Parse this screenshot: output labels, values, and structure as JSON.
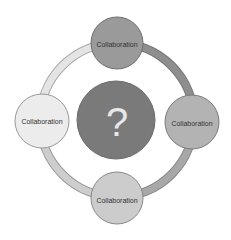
{
  "diagram": {
    "type": "cycle",
    "center": {
      "label": "?",
      "color": "#7a7a7a"
    },
    "nodes": [
      {
        "position": "top",
        "label": "Collaboration",
        "color": "#9a9a9a"
      },
      {
        "position": "right",
        "label": "Collaboration",
        "color": "#b3b3b3"
      },
      {
        "position": "bottom",
        "label": "Collaboration",
        "color": "#cccccc"
      },
      {
        "position": "left",
        "label": "Collaboration",
        "color": "#ececec"
      }
    ],
    "ring_segments": [
      {
        "from": "top",
        "to": "right",
        "color": "#8e8e8e"
      },
      {
        "from": "right",
        "to": "bottom",
        "color": "#a8a8a8"
      },
      {
        "from": "bottom",
        "to": "left",
        "color": "#cdcdcd"
      },
      {
        "from": "left",
        "to": "top",
        "color": "#e4e4e4"
      }
    ]
  }
}
